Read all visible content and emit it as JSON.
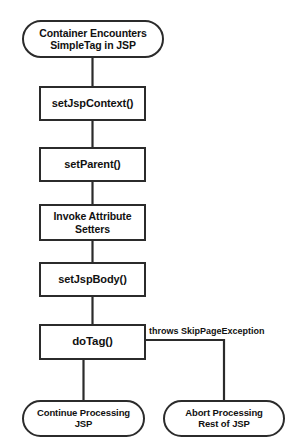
{
  "diagram": {
    "background_color": "#ffffff",
    "line_color": "#2b2b2b",
    "text_color": "#111111",
    "nodes": {
      "start": {
        "label": "Container Encounters\nSimpleTag in JSP",
        "shape": "terminal"
      },
      "set_jsp_context": {
        "label": "setJspContext()",
        "shape": "process"
      },
      "set_parent": {
        "label": "setParent()",
        "shape": "process"
      },
      "invoke_attribute_setters": {
        "label": "Invoke Attribute\nSetters",
        "shape": "process"
      },
      "set_jsp_body": {
        "label": "setJspBody()",
        "shape": "process"
      },
      "do_tag": {
        "label": "doTag()",
        "shape": "process"
      },
      "continue_processing": {
        "label": "Continue Processing\nJSP",
        "shape": "terminal"
      },
      "abort_processing": {
        "label": "Abort Processing\nRest of JSP",
        "shape": "terminal"
      }
    },
    "edge_labels": {
      "skip_page_exception": "throws SkipPageException"
    }
  }
}
